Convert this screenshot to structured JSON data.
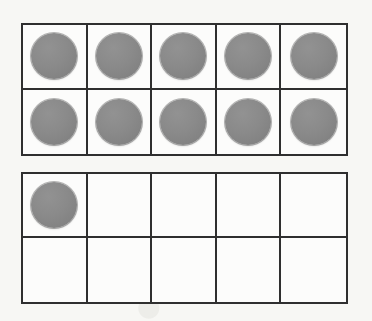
{
  "worksheet": {
    "title": "Ten Frames",
    "description": "Two five-by-two ten-frames with gray round counters",
    "background_color": "#f7f7f4",
    "frame_border_color": "#2f2f2f",
    "frame_fill_color": "#fcfcfb",
    "counter_color": "#8a8a8a",
    "total_counters": 11
  },
  "frames": [
    {
      "name": "ten-frame-1",
      "columns": 5,
      "rows": 2,
      "capacity": 10,
      "filled_count": 10,
      "cells": [
        {
          "row": 1,
          "col": 1,
          "filled": true
        },
        {
          "row": 1,
          "col": 2,
          "filled": true
        },
        {
          "row": 1,
          "col": 3,
          "filled": true
        },
        {
          "row": 1,
          "col": 4,
          "filled": true
        },
        {
          "row": 1,
          "col": 5,
          "filled": true
        },
        {
          "row": 2,
          "col": 1,
          "filled": true
        },
        {
          "row": 2,
          "col": 2,
          "filled": true
        },
        {
          "row": 2,
          "col": 3,
          "filled": true
        },
        {
          "row": 2,
          "col": 4,
          "filled": true
        },
        {
          "row": 2,
          "col": 5,
          "filled": true
        }
      ]
    },
    {
      "name": "ten-frame-2",
      "columns": 5,
      "rows": 2,
      "capacity": 10,
      "filled_count": 1,
      "cells": [
        {
          "row": 1,
          "col": 1,
          "filled": true
        },
        {
          "row": 1,
          "col": 2,
          "filled": false
        },
        {
          "row": 1,
          "col": 3,
          "filled": false
        },
        {
          "row": 1,
          "col": 4,
          "filled": false
        },
        {
          "row": 1,
          "col": 5,
          "filled": false
        },
        {
          "row": 2,
          "col": 1,
          "filled": false
        },
        {
          "row": 2,
          "col": 2,
          "filled": false
        },
        {
          "row": 2,
          "col": 3,
          "filled": false
        },
        {
          "row": 2,
          "col": 4,
          "filled": false
        },
        {
          "row": 2,
          "col": 5,
          "filled": false
        }
      ]
    }
  ]
}
